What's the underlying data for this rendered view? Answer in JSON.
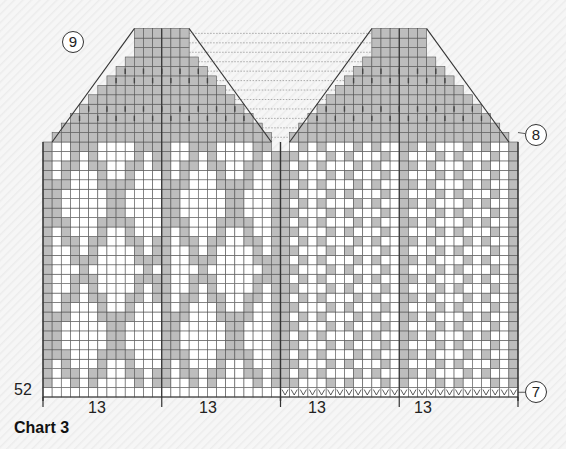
{
  "chart": {
    "title": "Chart 3",
    "stitch_count_label": "52",
    "repeat_labels": [
      "13",
      "13",
      "13",
      "13"
    ],
    "markers": {
      "top_left": "9",
      "right_side": "8",
      "bottom_right": "7"
    },
    "grid": {
      "stitches": 52,
      "body_rows": 27,
      "cap_rows": 12
    },
    "colors": {
      "contrast": "#bdbdbd",
      "main": "#ffffff",
      "line": "#333333"
    },
    "rows_bottom_to_top_left_half_sample": [
      "00000000000000000000000000",
      "00011000010000001100001100",
      "00011000111000011100011000",
      "00011101100100110000110000",
      "00001111000011100001100000"
    ],
    "right_half_pattern": "diagonal-checker",
    "bottom_edge_right_half": "v-stitch row"
  }
}
